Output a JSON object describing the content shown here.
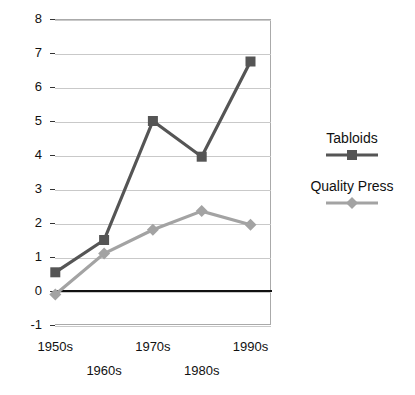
{
  "chart_data": {
    "type": "line",
    "title": "",
    "xlabel": "",
    "ylabel": "",
    "categories": [
      "1950s",
      "1960s",
      "1970s",
      "1980s",
      "1990s"
    ],
    "ylim": [
      -1,
      8
    ],
    "ytick_labels": [
      "8",
      "7",
      "6",
      "5",
      "4",
      "3",
      "2",
      "1",
      "0",
      "-1"
    ],
    "ytick_values": [
      8,
      7,
      6,
      5,
      4,
      3,
      2,
      1,
      0,
      -1
    ],
    "grid": true,
    "legend_position": "right",
    "series": [
      {
        "name": "Tabloids",
        "color": "#555555",
        "marker": "square",
        "values": [
          0.55,
          1.5,
          5.0,
          3.95,
          6.75
        ]
      },
      {
        "name": "Quality Press",
        "color": "#a3a3a3",
        "marker": "diamond",
        "values": [
          -0.1,
          1.1,
          1.8,
          2.35,
          1.95
        ]
      }
    ]
  },
  "legend": {
    "entries": [
      {
        "label": "Tabloids"
      },
      {
        "label": "Quality Press"
      }
    ]
  }
}
